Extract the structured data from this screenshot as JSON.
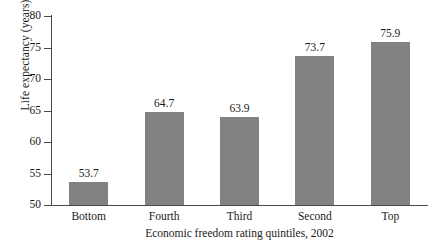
{
  "chart_data": {
    "type": "bar",
    "title": "",
    "subtitle": "",
    "categories": [
      "Bottom",
      "Fourth",
      "Third",
      "Second",
      "Top"
    ],
    "values": [
      53.7,
      64.7,
      63.9,
      73.7,
      75.9
    ],
    "value_labels": [
      "53.7",
      "64.7",
      "63.9",
      "73.7",
      "75.9"
    ],
    "xlabel": "Economic freedom rating quintiles, 2002",
    "ylabel": "Life expectancy (years)",
    "ylim": [
      50,
      80
    ],
    "yticks": [
      50,
      55,
      60,
      65,
      70,
      75,
      80
    ],
    "ytick_labels": [
      "50",
      "55",
      "60",
      "65",
      "70",
      "75",
      "80"
    ],
    "grid": false,
    "legend": null,
    "series": [
      {
        "name": "Life expectancy",
        "values": [
          53.7,
          64.7,
          63.9,
          73.7,
          75.9
        ],
        "color": "#828282"
      }
    ],
    "bar_color": "#828282",
    "axis_color": "#4a4a4a",
    "text_color": "#1a1a1a",
    "background": "#ffffff"
  }
}
